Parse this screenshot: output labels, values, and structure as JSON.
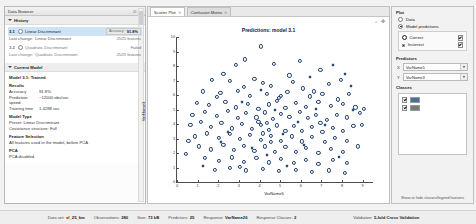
{
  "left_panel": {
    "title": "Data Browser",
    "close_icon": "close-icon",
    "dock_icon": "dock-icon",
    "history": {
      "header": "History",
      "items": [
        {
          "id": "3.1",
          "name": "Linear Discriminant",
          "last_change_label": "Last change:",
          "last_change_value": "Linear Discriminant",
          "accuracy_label": "Accuracy:",
          "accuracy_value": "91.8%",
          "features": "25/25 features",
          "selected": true
        },
        {
          "id": "3.2",
          "name": "Quadratic Discriminant",
          "last_change_label": "Last change:",
          "last_change_value": "Quadratic Discriminant",
          "accuracy_label": "",
          "accuracy_value": "Failed",
          "features": "25/25 features",
          "selected": false
        }
      ]
    },
    "current_model": {
      "header": "Current Model",
      "title": "Model 3.1: Trained",
      "results_header": "Results",
      "results": [
        {
          "key": "Accuracy",
          "value": "91.8%"
        },
        {
          "key": "Prediction speed",
          "value": "~12000 obs/sec"
        },
        {
          "key": "Training time",
          "value": "1.4288 sec"
        }
      ],
      "model_type_header": "Model Type",
      "model_type_lines": [
        "Preset: Linear Discriminant",
        "Covariance structure: Full"
      ],
      "feature_selection_header": "Feature Selection",
      "feature_selection_lines": [
        "All features used in the model, before PCA"
      ],
      "pca_header": "PCA",
      "pca_lines": [
        "PCA disabled"
      ]
    }
  },
  "center": {
    "tabs": [
      {
        "label": "Scatter Plot",
        "active": true,
        "close_icon": "close-icon"
      },
      {
        "label": "Confusion Matrix",
        "active": false,
        "close_icon": "close-icon"
      }
    ],
    "toolbar_icons": [
      "zoom-in-icon",
      "pan-icon",
      "reset-view-icon"
    ]
  },
  "right_panel": {
    "plot_section": {
      "header": "Plot",
      "options": [
        {
          "label": "Data",
          "selected": false
        },
        {
          "label": "Model predictions",
          "selected": true
        }
      ],
      "prediction_markers": [
        {
          "label": "Correct",
          "marker": "circle-marker",
          "checked": true
        },
        {
          "label": "Incorrect",
          "marker": "x-marker",
          "checked": true
        }
      ]
    },
    "predictors_section": {
      "header": "Predictors",
      "x_label": "X",
      "y_label": "Y",
      "x_value": "VarName5",
      "y_value": "VarName3"
    },
    "classes_section": {
      "header": "Classes",
      "items": [
        {
          "label": "",
          "checked": true,
          "color": "#4a6f9c"
        },
        {
          "label": "",
          "checked": true,
          "color": "#7a7a7a"
        }
      ]
    },
    "footer_note": "Show or hide classes/legend features"
  },
  "status_bar": {
    "items": [
      {
        "key": "Data set:",
        "value": "xl_25_km"
      },
      {
        "key": "Observations:",
        "value": "280"
      },
      {
        "key": "Size:",
        "value": "73 kB"
      },
      {
        "key": "Predictors:",
        "value": "25"
      },
      {
        "key": "Response:",
        "value": "VarName26"
      },
      {
        "key": "Response Classes:",
        "value": "2"
      },
      {
        "key": "Validation:",
        "value": "5-fold Cross Validation"
      }
    ]
  },
  "chart_data": {
    "type": "scatter",
    "title": "Predictions: model 3.1",
    "xlabel": "VarName5",
    "ylabel": "VarName3",
    "xlim": [
      0,
      9.5
    ],
    "ylim": [
      0,
      10
    ],
    "xticks": [
      0,
      1,
      2,
      3,
      4,
      5,
      6,
      7,
      8,
      9
    ],
    "yticks": [
      0,
      1,
      2,
      3,
      4,
      5,
      6,
      7,
      8,
      9,
      10
    ],
    "grid": false,
    "legend_position": "right-panel",
    "series": [
      {
        "name": "Correct",
        "marker": "circle",
        "color": "#1f3f6e",
        "points": [
          [
            4.05,
            9.35
          ],
          [
            3.3,
            8.45
          ],
          [
            4.7,
            8.15
          ],
          [
            6.95,
            7.75
          ],
          [
            1.7,
            7.05
          ],
          [
            2.55,
            6.95
          ],
          [
            3.75,
            7.1
          ],
          [
            4.15,
            6.85
          ],
          [
            4.55,
            6.6
          ],
          [
            5.6,
            6.9
          ],
          [
            6.1,
            6.45
          ],
          [
            7.35,
            6.75
          ],
          [
            1.25,
            6.25
          ],
          [
            2.1,
            6.15
          ],
          [
            2.95,
            6.3
          ],
          [
            3.55,
            5.95
          ],
          [
            4.35,
            6.1
          ],
          [
            4.95,
            5.8
          ],
          [
            5.35,
            6.2
          ],
          [
            6.45,
            5.9
          ],
          [
            7.05,
            6.05
          ],
          [
            7.8,
            5.7
          ],
          [
            8.35,
            6.1
          ],
          [
            0.95,
            5.45
          ],
          [
            1.55,
            5.3
          ],
          [
            2.35,
            5.55
          ],
          [
            2.85,
            5.15
          ],
          [
            3.45,
            5.4
          ],
          [
            3.95,
            5.05
          ],
          [
            4.45,
            5.35
          ],
          [
            4.85,
            5.6
          ],
          [
            5.25,
            5.1
          ],
          [
            5.75,
            5.45
          ],
          [
            6.25,
            5.2
          ],
          [
            6.85,
            5.55
          ],
          [
            7.45,
            5.25
          ],
          [
            8.05,
            5.4
          ],
          [
            8.65,
            5.15
          ],
          [
            0.75,
            4.65
          ],
          [
            1.35,
            4.85
          ],
          [
            1.95,
            4.55
          ],
          [
            2.45,
            4.9
          ],
          [
            2.95,
            4.4
          ],
          [
            3.35,
            4.75
          ],
          [
            3.85,
            4.45
          ],
          [
            4.25,
            4.8
          ],
          [
            4.65,
            4.35
          ],
          [
            5.05,
            4.7
          ],
          [
            5.45,
            4.5
          ],
          [
            5.95,
            4.85
          ],
          [
            6.35,
            4.4
          ],
          [
            6.75,
            4.65
          ],
          [
            7.25,
            4.3
          ],
          [
            7.75,
            4.6
          ],
          [
            8.25,
            4.45
          ],
          [
            8.85,
            4.75
          ],
          [
            0.65,
            3.95
          ],
          [
            1.15,
            4.15
          ],
          [
            1.65,
            3.8
          ],
          [
            2.15,
            4.05
          ],
          [
            2.65,
            3.7
          ],
          [
            3.15,
            4.0
          ],
          [
            3.65,
            3.65
          ],
          [
            4.05,
            3.95
          ],
          [
            4.45,
            3.6
          ],
          [
            4.85,
            3.9
          ],
          [
            5.25,
            3.55
          ],
          [
            5.65,
            3.85
          ],
          [
            6.05,
            3.5
          ],
          [
            6.55,
            3.8
          ],
          [
            7.05,
            3.45
          ],
          [
            7.55,
            3.75
          ],
          [
            8.05,
            3.55
          ],
          [
            8.55,
            3.85
          ],
          [
            0.85,
            3.15
          ],
          [
            1.45,
            3.35
          ],
          [
            2.05,
            3.05
          ],
          [
            2.55,
            3.3
          ],
          [
            3.05,
            2.95
          ],
          [
            3.55,
            3.25
          ],
          [
            4.05,
            2.9
          ],
          [
            4.55,
            3.2
          ],
          [
            5.05,
            2.85
          ],
          [
            5.55,
            3.15
          ],
          [
            6.05,
            2.8
          ],
          [
            6.55,
            3.1
          ],
          [
            7.15,
            2.75
          ],
          [
            7.65,
            3.05
          ],
          [
            8.25,
            2.85
          ],
          [
            1.05,
            2.45
          ],
          [
            1.65,
            2.25
          ],
          [
            2.25,
            2.55
          ],
          [
            2.75,
            2.2
          ],
          [
            3.25,
            2.5
          ],
          [
            3.75,
            2.15
          ],
          [
            4.25,
            2.45
          ],
          [
            4.75,
            2.1
          ],
          [
            5.25,
            2.4
          ],
          [
            5.75,
            2.05
          ],
          [
            6.25,
            2.35
          ],
          [
            6.85,
            2.0
          ],
          [
            7.45,
            2.3
          ],
          [
            8.05,
            2.1
          ],
          [
            1.35,
            1.65
          ],
          [
            2.05,
            1.45
          ],
          [
            2.65,
            1.7
          ],
          [
            3.25,
            1.4
          ],
          [
            3.85,
            1.65
          ],
          [
            4.45,
            1.35
          ],
          [
            5.05,
            1.6
          ],
          [
            5.65,
            1.3
          ],
          [
            6.25,
            1.55
          ],
          [
            6.85,
            1.25
          ],
          [
            7.55,
            1.5
          ],
          [
            8.25,
            1.3
          ],
          [
            1.85,
            0.85
          ],
          [
            2.55,
            0.95
          ],
          [
            3.35,
            0.8
          ],
          [
            4.15,
            0.9
          ],
          [
            4.95,
            0.75
          ],
          [
            5.75,
            0.85
          ],
          [
            6.55,
            0.7
          ],
          [
            7.35,
            0.8
          ],
          [
            8.15,
            0.65
          ],
          [
            3.95,
            4.15
          ],
          [
            4.35,
            4.05
          ],
          [
            4.15,
            3.35
          ],
          [
            4.55,
            2.75
          ],
          [
            5.05,
            5.95
          ],
          [
            3.25,
            6.55
          ],
          [
            6.65,
            6.25
          ],
          [
            2.25,
            7.45
          ],
          [
            5.45,
            7.35
          ],
          [
            7.95,
            7.05
          ],
          [
            0.55,
            2.85
          ],
          [
            0.45,
            1.95
          ],
          [
            8.95,
            3.95
          ],
          [
            8.75,
            2.45
          ],
          [
            9.05,
            5.05
          ],
          [
            2.85,
            8.05
          ],
          [
            5.95,
            8.35
          ],
          [
            1.95,
            5.85
          ],
          [
            6.95,
            4.05
          ],
          [
            3.05,
            1.05
          ]
        ]
      },
      {
        "name": "Incorrect",
        "marker": "x",
        "color": "#1f3f6e",
        "points": [
          [
            7.55,
            8.05
          ],
          [
            6.45,
            7.25
          ],
          [
            8.45,
            6.65
          ],
          [
            3.15,
            5.55
          ],
          [
            4.75,
            4.95
          ],
          [
            5.85,
            4.15
          ],
          [
            7.15,
            3.95
          ],
          [
            2.45,
            3.45
          ],
          [
            6.15,
            2.55
          ],
          [
            4.35,
            1.85
          ],
          [
            5.35,
            1.15
          ],
          [
            7.85,
            1.75
          ],
          [
            1.25,
            1.15
          ],
          [
            8.55,
            4.95
          ],
          [
            3.65,
            2.35
          ],
          [
            6.75,
            5.05
          ],
          [
            2.15,
            2.75
          ],
          [
            5.15,
            3.35
          ],
          [
            4.05,
            6.35
          ],
          [
            8.15,
            7.45
          ]
        ]
      }
    ]
  }
}
